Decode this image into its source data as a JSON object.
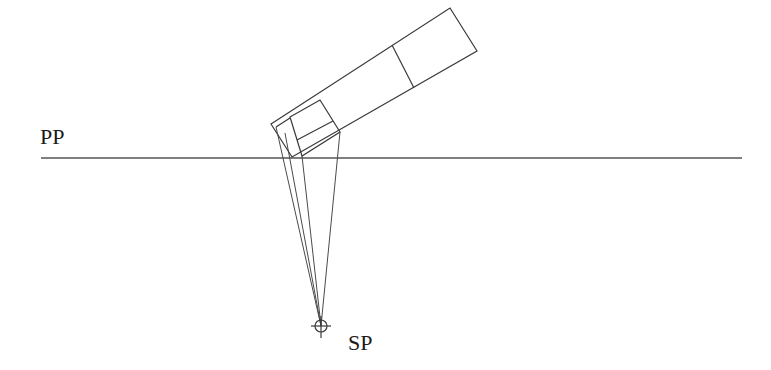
{
  "diagram": {
    "labels": {
      "picture_plane": "PP",
      "station_point": "SP"
    },
    "colors": {
      "line": "#3a3a3a",
      "background": "#ffffff"
    },
    "picture_plane": {
      "x1": 41,
      "y": 158,
      "x2": 742
    },
    "station_point": {
      "x": 321,
      "y": 326,
      "r": 6
    },
    "object_outer": [
      [
        271,
        124
      ],
      [
        450,
        8
      ],
      [
        477,
        51
      ],
      [
        292,
        157
      ]
    ],
    "object_divider": [
      [
        392,
        45
      ],
      [
        414,
        88
      ]
    ],
    "object_inner": [
      [
        290,
        117
      ],
      [
        320,
        100
      ],
      [
        340,
        132
      ],
      [
        302,
        156
      ]
    ],
    "object_inner_cross": [
      [
        297,
        140
      ],
      [
        333,
        122
      ]
    ],
    "object_inner_left": [
      [
        276,
        127
      ],
      [
        290,
        117
      ]
    ],
    "projectors": [
      [
        276,
        127
      ],
      [
        285,
        133
      ],
      [
        302,
        156
      ],
      [
        340,
        132
      ]
    ]
  }
}
